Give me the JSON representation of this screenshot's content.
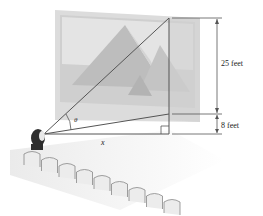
{
  "diagram": {
    "labels": {
      "screen_height": "25 feet",
      "screen_elevation": "8 feet",
      "distance": "x",
      "angle": "θ"
    },
    "colors": {
      "line": "#555555",
      "screen": "#d9d9d9",
      "picture": "#c8c8c8",
      "seats": "#e6e6e6"
    },
    "seat_count": 9
  }
}
